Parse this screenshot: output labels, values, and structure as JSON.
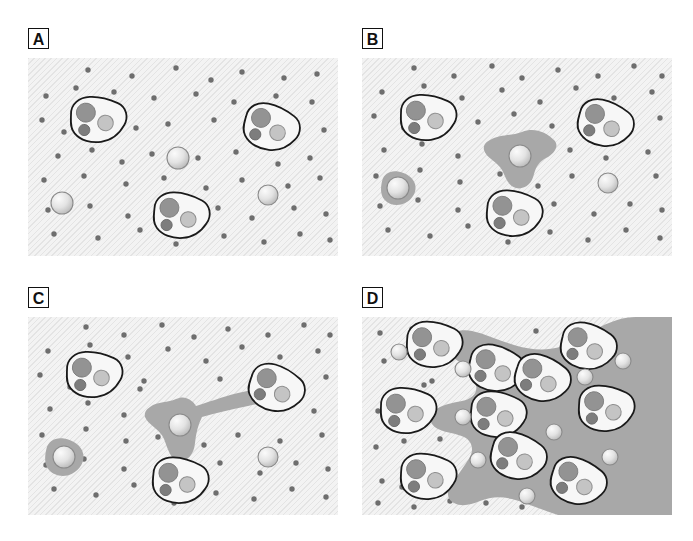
{
  "figure": {
    "width": 693,
    "height": 541,
    "background_color": "#ffffff"
  },
  "colors": {
    "panel_background": "#f3f3f3",
    "panel_texture": "#cdcdcd",
    "matrix_gray": "#a8a8a8",
    "halo_gray": "#a8a8a8",
    "dot_color": "#6e6e6e",
    "cell_outline": "#1a1a1a",
    "cell_body": "#f7f7f7",
    "nucleus_large": "#939393",
    "nucleus_small": "#7d7d7d",
    "vacuole": "#c4c4c4",
    "sphere_light": "#f2f2f2",
    "sphere_mid": "#cfcfcf",
    "sphere_outline": "#8a8a8a",
    "label_border": "#111111",
    "label_text": "#111111"
  },
  "panels": [
    {
      "id": "panel-a",
      "label": "A",
      "caption_visible": false,
      "stage_description": "Intact matrix with scattered dots; three cells and three free spheres, no degradation",
      "matrix_degraded": false,
      "cells": [
        {
          "cx": 70,
          "cy": 62,
          "rot": -8
        },
        {
          "cx": 243,
          "cy": 70,
          "rot": 6
        },
        {
          "cx": 153,
          "cy": 158,
          "rot": -4
        }
      ],
      "spheres": [
        {
          "cx": 150,
          "cy": 100,
          "r": 11
        },
        {
          "cx": 34,
          "cy": 145,
          "r": 11
        },
        {
          "cx": 240,
          "cy": 137,
          "r": 10
        }
      ],
      "halos": [],
      "dots": [
        [
          60,
          12
        ],
        [
          104,
          18
        ],
        [
          148,
          10
        ],
        [
          183,
          22
        ],
        [
          214,
          14
        ],
        [
          256,
          20
        ],
        [
          289,
          16
        ],
        [
          18,
          38
        ],
        [
          48,
          30
        ],
        [
          86,
          34
        ],
        [
          126,
          40
        ],
        [
          168,
          36
        ],
        [
          206,
          44
        ],
        [
          248,
          38
        ],
        [
          284,
          44
        ],
        [
          14,
          62
        ],
        [
          36,
          74
        ],
        [
          108,
          70
        ],
        [
          140,
          66
        ],
        [
          186,
          62
        ],
        [
          222,
          76
        ],
        [
          264,
          66
        ],
        [
          296,
          72
        ],
        [
          30,
          98
        ],
        [
          64,
          92
        ],
        [
          94,
          104
        ],
        [
          124,
          96
        ],
        [
          170,
          100
        ],
        [
          208,
          94
        ],
        [
          250,
          106
        ],
        [
          282,
          100
        ],
        [
          16,
          122
        ],
        [
          56,
          118
        ],
        [
          98,
          126
        ],
        [
          136,
          120
        ],
        [
          178,
          130
        ],
        [
          214,
          122
        ],
        [
          260,
          128
        ],
        [
          292,
          120
        ],
        [
          20,
          152
        ],
        [
          62,
          148
        ],
        [
          100,
          158
        ],
        [
          190,
          150
        ],
        [
          224,
          160
        ],
        [
          266,
          150
        ],
        [
          298,
          156
        ],
        [
          26,
          176
        ],
        [
          70,
          180
        ],
        [
          112,
          172
        ],
        [
          148,
          186
        ],
        [
          196,
          178
        ],
        [
          236,
          184
        ],
        [
          272,
          176
        ],
        [
          302,
          182
        ]
      ]
    },
    {
      "id": "panel-b",
      "label": "B",
      "caption_visible": false,
      "stage_description": "Small localized halos of degraded matrix appear around two spheres",
      "matrix_degraded": false,
      "cells": [
        {
          "cx": 66,
          "cy": 60,
          "rot": -8
        },
        {
          "cx": 243,
          "cy": 66,
          "rot": 6
        },
        {
          "cx": 152,
          "cy": 156,
          "rot": -4
        }
      ],
      "spheres": [
        {
          "cx": 158,
          "cy": 98,
          "r": 11
        },
        {
          "cx": 36,
          "cy": 130,
          "r": 11
        },
        {
          "cx": 246,
          "cy": 125,
          "r": 10
        }
      ],
      "halos": [
        {
          "type": "star",
          "cx": 158,
          "cy": 98,
          "scale": 1.0
        },
        {
          "type": "blob",
          "cx": 36,
          "cy": 130,
          "scale": 0.72
        }
      ],
      "dots": [
        [
          52,
          10
        ],
        [
          92,
          18
        ],
        [
          130,
          8
        ],
        [
          160,
          20
        ],
        [
          196,
          12
        ],
        [
          236,
          18
        ],
        [
          272,
          8
        ],
        [
          300,
          18
        ],
        [
          20,
          34
        ],
        [
          62,
          28
        ],
        [
          100,
          40
        ],
        [
          140,
          32
        ],
        [
          178,
          44
        ],
        [
          214,
          30
        ],
        [
          252,
          40
        ],
        [
          290,
          34
        ],
        [
          12,
          58
        ],
        [
          42,
          70
        ],
        [
          116,
          64
        ],
        [
          152,
          56
        ],
        [
          190,
          68
        ],
        [
          226,
          60
        ],
        [
          262,
          70
        ],
        [
          298,
          60
        ],
        [
          22,
          92
        ],
        [
          60,
          86
        ],
        [
          96,
          98
        ],
        [
          134,
          90
        ],
        [
          172,
          104
        ],
        [
          208,
          92
        ],
        [
          244,
          100
        ],
        [
          286,
          94
        ],
        [
          14,
          118
        ],
        [
          58,
          112
        ],
        [
          98,
          124
        ],
        [
          138,
          116
        ],
        [
          176,
          128
        ],
        [
          210,
          118
        ],
        [
          252,
          124
        ],
        [
          294,
          118
        ],
        [
          18,
          148
        ],
        [
          56,
          142
        ],
        [
          96,
          152
        ],
        [
          192,
          146
        ],
        [
          232,
          156
        ],
        [
          268,
          146
        ],
        [
          300,
          152
        ],
        [
          26,
          172
        ],
        [
          68,
          178
        ],
        [
          106,
          168
        ],
        [
          146,
          184
        ],
        [
          188,
          174
        ],
        [
          226,
          182
        ],
        [
          264,
          172
        ],
        [
          298,
          180
        ]
      ]
    },
    {
      "id": "panel-c",
      "label": "C",
      "caption_visible": false,
      "stage_description": "Degraded halo extends as a track/bridge connecting the central sphere to a cell at right",
      "matrix_degraded": false,
      "cells": [
        {
          "cx": 66,
          "cy": 58,
          "rot": -8
        },
        {
          "cx": 248,
          "cy": 72,
          "rot": 10
        },
        {
          "cx": 152,
          "cy": 164,
          "rot": -4
        }
      ],
      "spheres": [
        {
          "cx": 152,
          "cy": 108,
          "r": 11
        },
        {
          "cx": 36,
          "cy": 140,
          "r": 11
        },
        {
          "cx": 240,
          "cy": 140,
          "r": 10
        }
      ],
      "halos": [
        {
          "type": "bridge",
          "cx": 152,
          "cy": 108,
          "scale": 1.0
        },
        {
          "type": "blob",
          "cx": 36,
          "cy": 140,
          "scale": 0.8
        }
      ],
      "dots": [
        [
          58,
          10
        ],
        [
          96,
          18
        ],
        [
          134,
          8
        ],
        [
          166,
          20
        ],
        [
          200,
          12
        ],
        [
          240,
          18
        ],
        [
          276,
          8
        ],
        [
          302,
          18
        ],
        [
          20,
          34
        ],
        [
          62,
          28
        ],
        [
          100,
          40
        ],
        [
          140,
          32
        ],
        [
          178,
          44
        ],
        [
          214,
          30
        ],
        [
          252,
          40
        ],
        [
          290,
          34
        ],
        [
          12,
          58
        ],
        [
          42,
          70
        ],
        [
          116,
          64
        ],
        [
          192,
          62
        ],
        [
          226,
          58
        ],
        [
          262,
          70
        ],
        [
          298,
          60
        ],
        [
          22,
          92
        ],
        [
          60,
          86
        ],
        [
          96,
          98
        ],
        [
          112,
          72
        ],
        [
          286,
          94
        ],
        [
          14,
          118
        ],
        [
          58,
          112
        ],
        [
          98,
          124
        ],
        [
          130,
          120
        ],
        [
          176,
          128
        ],
        [
          210,
          118
        ],
        [
          252,
          124
        ],
        [
          294,
          118
        ],
        [
          18,
          148
        ],
        [
          56,
          142
        ],
        [
          96,
          152
        ],
        [
          192,
          146
        ],
        [
          232,
          156
        ],
        [
          268,
          146
        ],
        [
          300,
          152
        ],
        [
          26,
          172
        ],
        [
          68,
          178
        ],
        [
          106,
          168
        ],
        [
          146,
          186
        ],
        [
          188,
          176
        ],
        [
          226,
          182
        ],
        [
          264,
          172
        ],
        [
          298,
          180
        ]
      ]
    },
    {
      "id": "panel-d",
      "label": "D",
      "caption_visible": false,
      "stage_description": "Extensive matrix degradation; large gray field occupies right side, many cells and small spheres within it",
      "matrix_degraded": true,
      "cells": [
        {
          "cx": 72,
          "cy": 28,
          "rot": -6
        },
        {
          "cx": 46,
          "cy": 94,
          "rot": -8
        },
        {
          "cx": 66,
          "cy": 160,
          "rot": -6
        },
        {
          "cx": 134,
          "cy": 52,
          "rot": 4
        },
        {
          "cx": 180,
          "cy": 62,
          "rot": 8
        },
        {
          "cx": 136,
          "cy": 98,
          "rot": -4
        },
        {
          "cx": 156,
          "cy": 140,
          "rot": 6
        },
        {
          "cx": 226,
          "cy": 30,
          "rot": 4
        },
        {
          "cx": 244,
          "cy": 92,
          "rot": -6
        },
        {
          "cx": 216,
          "cy": 165,
          "rot": 8
        }
      ],
      "spheres": [
        {
          "cx": 37,
          "cy": 35,
          "r": 8
        },
        {
          "cx": 101,
          "cy": 52,
          "r": 8
        },
        {
          "cx": 101,
          "cy": 100,
          "r": 8
        },
        {
          "cx": 116,
          "cy": 143,
          "r": 8
        },
        {
          "cx": 165,
          "cy": 179,
          "r": 8
        },
        {
          "cx": 192,
          "cy": 115,
          "r": 8
        },
        {
          "cx": 223,
          "cy": 60,
          "r": 8
        },
        {
          "cx": 261,
          "cy": 44,
          "r": 8
        },
        {
          "cx": 248,
          "cy": 140,
          "r": 8
        }
      ],
      "halos": [],
      "dots": [
        [
          18,
          16
        ],
        [
          50,
          12
        ],
        [
          174,
          14
        ],
        [
          22,
          44
        ],
        [
          62,
          68
        ],
        [
          56,
          38
        ],
        [
          16,
          94
        ],
        [
          70,
          64
        ],
        [
          14,
          130
        ],
        [
          42,
          124
        ],
        [
          78,
          122
        ],
        [
          20,
          164
        ],
        [
          16,
          186
        ],
        [
          52,
          190
        ],
        [
          88,
          184
        ],
        [
          124,
          186
        ],
        [
          160,
          190
        ],
        [
          40,
          170
        ],
        [
          96,
          176
        ]
      ]
    }
  ],
  "legend": {
    "items": [
      {
        "name": "cell",
        "description": "Irregular cell with one large nucleus, one small dark granule and one pale vacuole"
      },
      {
        "name": "free-sphere",
        "description": "Shaded spherical particle free in the matrix"
      },
      {
        "name": "matrix-dot",
        "description": "Small dark dot representing intact matrix component"
      },
      {
        "name": "degraded-zone",
        "description": "Medium gray region representing degraded / remodelled matrix"
      }
    ]
  }
}
